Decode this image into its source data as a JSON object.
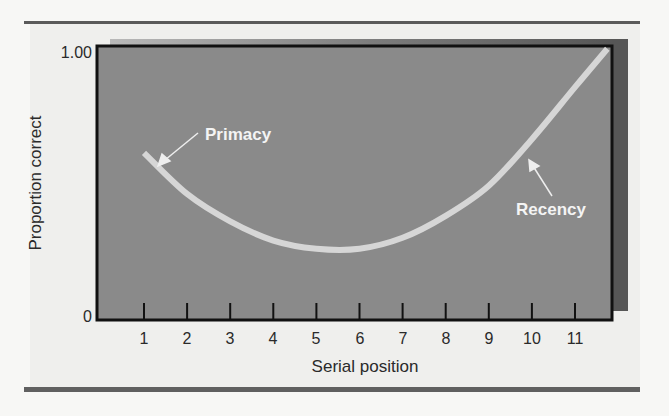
{
  "chart_data": {
    "type": "line",
    "title": "",
    "xlabel": "Serial position",
    "ylabel": "Proportion correct",
    "x": [
      1,
      2,
      3,
      4,
      5,
      6,
      7,
      8,
      9,
      10,
      11
    ],
    "series": [
      {
        "name": "Serial position curve",
        "values": [
          0.61,
          0.46,
          0.36,
          0.29,
          0.26,
          0.26,
          0.3,
          0.38,
          0.49,
          0.66,
          0.85
        ]
      }
    ],
    "curve_extends_to": {
      "x": 11.75,
      "y": 0.99
    },
    "x_ticks": [
      "1",
      "2",
      "3",
      "4",
      "5",
      "6",
      "7",
      "8",
      "9",
      "10",
      "11"
    ],
    "y_ticks": [
      "0",
      "1.00"
    ],
    "ylim": [
      0,
      1.0
    ],
    "xlim": [
      0,
      11.9
    ],
    "grid": false,
    "legend": null,
    "annotations": [
      {
        "text": "Primacy",
        "points_to": {
          "x": 1.1,
          "y": 0.58
        }
      },
      {
        "text": "Recency",
        "points_to": {
          "x": 10.0,
          "y": 0.66
        }
      }
    ],
    "colors": {
      "plot_background": "#8a8a8a",
      "curve": "#d9d9d9",
      "shadow": "#5e5e5e",
      "axis": "#111111",
      "rules": "#5a5a5a"
    }
  },
  "axes": {
    "y_label": "Proportion correct",
    "y_top": "1.00",
    "y_bottom": "0",
    "x_label": "Serial position",
    "x_ticks": [
      "1",
      "2",
      "3",
      "4",
      "5",
      "6",
      "7",
      "8",
      "9",
      "10",
      "11"
    ]
  },
  "annotations": {
    "primacy": "Primacy",
    "recency": "Recency"
  }
}
